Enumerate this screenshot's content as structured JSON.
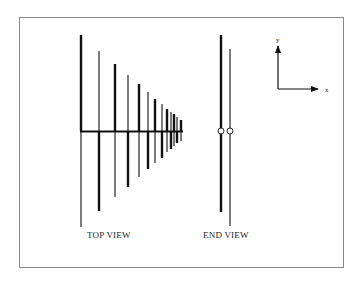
{
  "figure": {
    "frame_color": "#8a8a8a",
    "line_color": "#111111"
  },
  "top_view": {
    "label": "TOP VIEW",
    "label_x": 87,
    "label_y": 238,
    "boom": {
      "x1": 80,
      "x2": 183,
      "y": 131.5,
      "width": 2
    },
    "elements": [
      {
        "x": 81,
        "top": 35,
        "bottom": 131,
        "width": 2.4
      },
      {
        "x": 81,
        "top": 131,
        "bottom": 227,
        "width": 1.1
      },
      {
        "x": 99,
        "top": 51,
        "bottom": 131,
        "width": 1.1
      },
      {
        "x": 99,
        "top": 131,
        "bottom": 211,
        "width": 2.4
      },
      {
        "x": 115,
        "top": 64,
        "bottom": 131,
        "width": 2.4
      },
      {
        "x": 115,
        "top": 131,
        "bottom": 197,
        "width": 1.1
      },
      {
        "x": 128,
        "top": 75,
        "bottom": 131,
        "width": 1.1
      },
      {
        "x": 128,
        "top": 131,
        "bottom": 187,
        "width": 2.4
      },
      {
        "x": 139,
        "top": 84,
        "bottom": 131,
        "width": 2.4
      },
      {
        "x": 139,
        "top": 131,
        "bottom": 177,
        "width": 1.1
      },
      {
        "x": 148,
        "top": 92,
        "bottom": 131,
        "width": 1.1
      },
      {
        "x": 148,
        "top": 131,
        "bottom": 169,
        "width": 2.4
      },
      {
        "x": 155,
        "top": 99,
        "bottom": 131,
        "width": 2.4
      },
      {
        "x": 155,
        "top": 131,
        "bottom": 163,
        "width": 1.1
      },
      {
        "x": 162,
        "top": 104,
        "bottom": 131,
        "width": 1.1
      },
      {
        "x": 162,
        "top": 131,
        "bottom": 158,
        "width": 2.4
      },
      {
        "x": 167,
        "top": 109,
        "bottom": 131,
        "width": 2.4
      },
      {
        "x": 167,
        "top": 131,
        "bottom": 152,
        "width": 1.1
      },
      {
        "x": 171,
        "top": 112,
        "bottom": 131,
        "width": 1.1
      },
      {
        "x": 171,
        "top": 131,
        "bottom": 149,
        "width": 2.4
      },
      {
        "x": 174,
        "top": 114,
        "bottom": 131,
        "width": 2.4
      },
      {
        "x": 174,
        "top": 131,
        "bottom": 146,
        "width": 1.1
      },
      {
        "x": 177,
        "top": 117,
        "bottom": 131,
        "width": 1.1
      },
      {
        "x": 177,
        "top": 131,
        "bottom": 143,
        "width": 2.4
      },
      {
        "x": 181,
        "top": 120,
        "bottom": 131,
        "width": 2.4
      },
      {
        "x": 181,
        "top": 131,
        "bottom": 141,
        "width": 1.1
      }
    ]
  },
  "end_view": {
    "label": "END VIEW",
    "label_x": 203,
    "label_y": 238,
    "conductors": [
      {
        "x": 221,
        "top": 35,
        "bottom": 212,
        "width": 2.4
      },
      {
        "x": 230,
        "top": 49,
        "bottom": 226,
        "width": 1.1
      }
    ],
    "feed_points": [
      {
        "cx": 221,
        "cy": 131,
        "r": 3
      },
      {
        "cx": 230,
        "cy": 131,
        "r": 3
      }
    ]
  },
  "axes": {
    "origin": {
      "x": 278,
      "y": 89
    },
    "y_tip": 46,
    "x_tip": 318,
    "y_label": "y",
    "x_label": "x",
    "y_label_pos": {
      "x": 276,
      "y": 42
    },
    "x_label_pos": {
      "x": 325,
      "y": 92
    }
  }
}
